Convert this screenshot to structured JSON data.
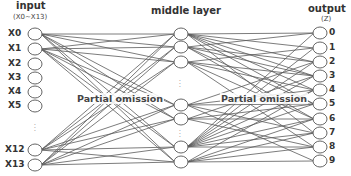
{
  "layers": {
    "input": {
      "title": "input",
      "subtitle": "(X0~X13)",
      "nodes": [
        {
          "label": "X0",
          "y": 34
        },
        {
          "label": "X1",
          "y": 49
        },
        {
          "label": "X2",
          "y": 64
        },
        {
          "label": "X3",
          "y": 78
        },
        {
          "label": "X4",
          "y": 92
        },
        {
          "label": "X5",
          "y": 106
        },
        {
          "label": "X12",
          "y": 150
        },
        {
          "label": "X13",
          "y": 165
        }
      ],
      "ellipsis": "⋮"
    },
    "middle": {
      "title": "middle layer",
      "node_ys": [
        34,
        47,
        62,
        105,
        119,
        147,
        162
      ],
      "ellipsis": "⋮"
    },
    "output": {
      "title": "output",
      "subtitle": "(Z)",
      "nodes": [
        {
          "label": "0",
          "y": 33
        },
        {
          "label": "1",
          "y": 48
        },
        {
          "label": "2",
          "y": 62
        },
        {
          "label": "3",
          "y": 76
        },
        {
          "label": "4",
          "y": 90
        },
        {
          "label": "5",
          "y": 104
        },
        {
          "label": "6",
          "y": 119
        },
        {
          "label": "7",
          "y": 133
        },
        {
          "label": "8",
          "y": 147
        },
        {
          "label": "9",
          "y": 161
        }
      ]
    }
  },
  "annotations": {
    "left_omission": "Partial omission",
    "right_omission": "Partial omission"
  },
  "colors": {
    "edge": "#5a5a5a",
    "node_stroke": "#666666",
    "text": "#333333"
  }
}
